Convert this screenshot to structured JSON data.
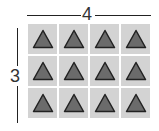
{
  "diagram": {
    "top_label": "4",
    "side_label": "3",
    "columns": 4,
    "rows": 3,
    "shape": "triangle-icon",
    "colors": {
      "tile": "#d3d3d3",
      "shape_fill": "#6b6b6b",
      "shape_stroke": "#222222",
      "line": "#222222"
    },
    "tiles": [
      [
        "triangle",
        "triangle",
        "triangle",
        "triangle"
      ],
      [
        "triangle",
        "triangle",
        "triangle",
        "triangle"
      ],
      [
        "triangle",
        "triangle",
        "triangle",
        "triangle"
      ]
    ]
  }
}
